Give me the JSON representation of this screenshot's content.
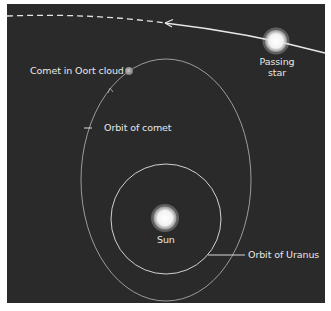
{
  "diagram": {
    "colors": {
      "background": "#2a2a2a",
      "page": "#ffffff",
      "lines": "#d8d8d8",
      "text": "#e8e8e8"
    },
    "labels": {
      "comet_in_oort_cloud": "Comet in Oort cloud",
      "passing_star_line1": "Passing",
      "passing_star_line2": "star",
      "orbit_of_comet": "Orbit of comet",
      "sun": "Sun",
      "orbit_of_uranus": "Orbit of Uranus"
    },
    "elements": [
      {
        "name": "passing-star",
        "type": "glowing-circle",
        "cx": 276,
        "cy": 41,
        "r": 11
      },
      {
        "name": "star-path",
        "type": "curve",
        "style": "solid-then-dashed",
        "arrow": "leftward"
      },
      {
        "name": "comet",
        "type": "small-circle",
        "cx": 129,
        "cy": 71,
        "r": 4
      },
      {
        "name": "comet-orbit",
        "type": "ellipse",
        "cx": 166,
        "cy": 180,
        "rx": 85,
        "ry": 120
      },
      {
        "name": "uranus-orbit",
        "type": "circle",
        "cx": 166,
        "cy": 219,
        "r": 56
      },
      {
        "name": "sun",
        "type": "glowing-circle",
        "cx": 165,
        "cy": 218,
        "r": 12
      }
    ]
  }
}
